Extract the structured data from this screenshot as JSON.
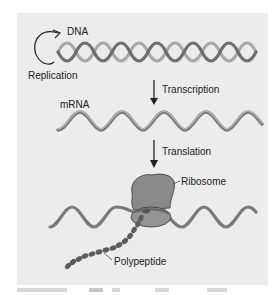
{
  "diagram": {
    "labels": {
      "dna": "DNA",
      "replication": "Replication",
      "transcription": "Transcription",
      "mrna": "mRNA",
      "translation": "Translation",
      "ribosome": "Ribosome",
      "polypeptide": "Polypeptide"
    },
    "colors": {
      "panel_bg": "#ececec",
      "strand_dark": "#6e6e6e",
      "strand_light": "#a8a8a8",
      "ribosome": "#8a8a8a",
      "polypeptide": "#5c5c5c",
      "arrow": "#222222"
    },
    "nodes": [
      {
        "id": "dna",
        "label": "DNA"
      },
      {
        "id": "mrna",
        "label": "mRNA"
      },
      {
        "id": "polypeptide",
        "label": "Polypeptide"
      }
    ],
    "edges": [
      {
        "from": "dna",
        "to": "dna",
        "label": "Replication"
      },
      {
        "from": "dna",
        "to": "mrna",
        "label": "Transcription"
      },
      {
        "from": "mrna",
        "to": "polypeptide",
        "label": "Translation"
      }
    ]
  }
}
